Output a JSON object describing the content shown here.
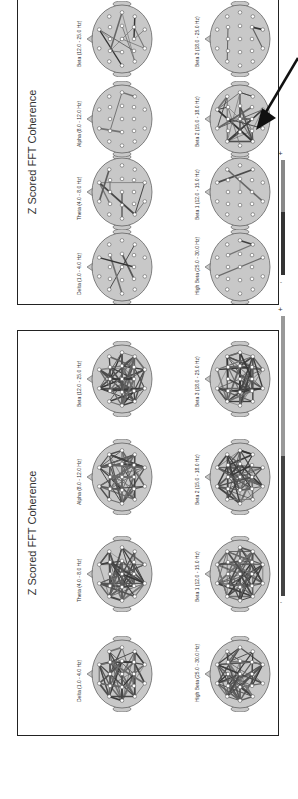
{
  "figure": {
    "orientation": "rotated-90-ccw",
    "panels": [
      {
        "id": "top",
        "title": "Z Scored FFT Coherence",
        "density": "sparse",
        "maps": [
          {
            "label": "Delta (1.0 - 4.0 Hz)",
            "edges": 4
          },
          {
            "label": "Theta (4.0 - 8.0 Hz)",
            "edges": 8
          },
          {
            "label": "Alpha (8.0 - 12.0 Hz)",
            "edges": 3
          },
          {
            "label": "Beta (12.0 - 25.0 Hz)",
            "edges": 12
          },
          {
            "label": "High Beta (25.0 - 30.0 Hz)",
            "edges": 3
          },
          {
            "label": "Beta 1 (12.0 - 15.0 Hz)",
            "edges": 3
          },
          {
            "label": "Beta 2 (15.0 - 18.0 Hz)",
            "edges": 30
          },
          {
            "label": "Beta 3 (18.0 - 25.0 Hz)",
            "edges": 3
          }
        ]
      },
      {
        "id": "bottom",
        "title": "Z Scored FFT Coherence",
        "density": "dense",
        "maps": [
          {
            "label": "Delta (1.0 - 4.0 Hz)",
            "edges": 60
          },
          {
            "label": "Theta (4.0 - 8.0 Hz)",
            "edges": 60
          },
          {
            "label": "Alpha (8.0 - 12.0 Hz)",
            "edges": 60
          },
          {
            "label": "Beta (12.0 - 25.0 Hz)",
            "edges": 60
          },
          {
            "label": "High Beta (25.0 - 30.0 Hz)",
            "edges": 60
          },
          {
            "label": "Beta 1 (12.0 - 15.0 Hz)",
            "edges": 60
          },
          {
            "label": "Beta 2 (15.0 - 18.0 Hz)",
            "edges": 60
          },
          {
            "label": "Beta 3 (18.0 - 25.0 Hz)",
            "edges": 60
          }
        ]
      }
    ],
    "colorbars": [
      {
        "plus": "+",
        "minus": "-"
      },
      {
        "plus": "+",
        "minus": "-"
      }
    ],
    "annotation": {
      "type": "arrow",
      "points_to": "Beta 2 (15.0 - 18.0 Hz)",
      "panel": "top"
    },
    "colors": {
      "head_fill": "#c8c8c8",
      "head_stroke": "#555555",
      "electrode_fill": "#ffffff",
      "edge_color": "#555555",
      "border": "#222222"
    }
  }
}
